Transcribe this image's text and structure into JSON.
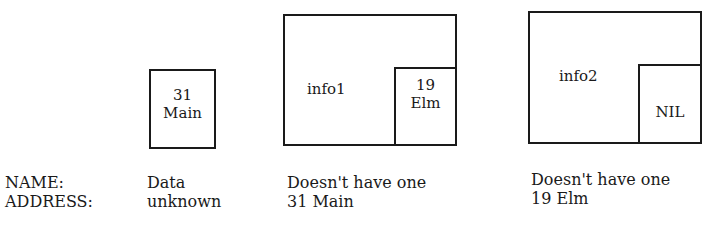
{
  "diagram": {
    "cells": [
      {
        "id": "addr-31-main",
        "lines": [
          "31",
          "Main"
        ]
      },
      {
        "id": "info1",
        "label": "info1",
        "inner": [
          "19",
          "Elm"
        ]
      },
      {
        "id": "info2",
        "label": "info2",
        "inner": [
          "NIL"
        ]
      }
    ],
    "row_labels": {
      "name": "NAME:",
      "address": "ADDRESS:"
    },
    "columns": [
      {
        "name": "Data",
        "address": "unknown"
      },
      {
        "name": "Doesn't have one",
        "address": "31 Main"
      },
      {
        "name": "Doesn't have one",
        "address": "19 Elm"
      }
    ]
  }
}
